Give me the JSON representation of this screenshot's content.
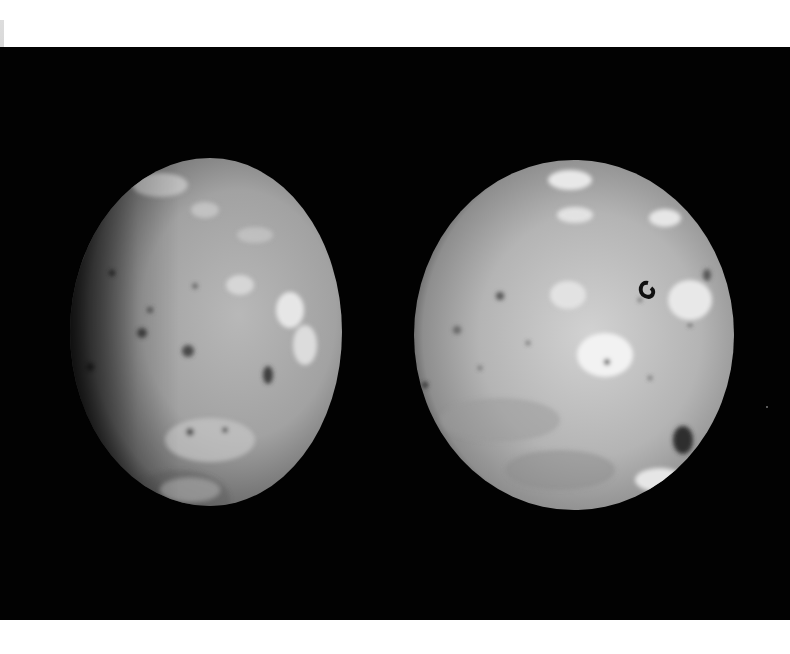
{
  "image": {
    "subject": "Two views of Io, moon of Jupiter",
    "background_color": "#020202",
    "border_color": "#ffffff",
    "bodies": [
      {
        "name": "io-view-left",
        "phase": "gibbous, terminator on left"
      },
      {
        "name": "io-view-right",
        "phase": "near full disk"
      }
    ]
  }
}
